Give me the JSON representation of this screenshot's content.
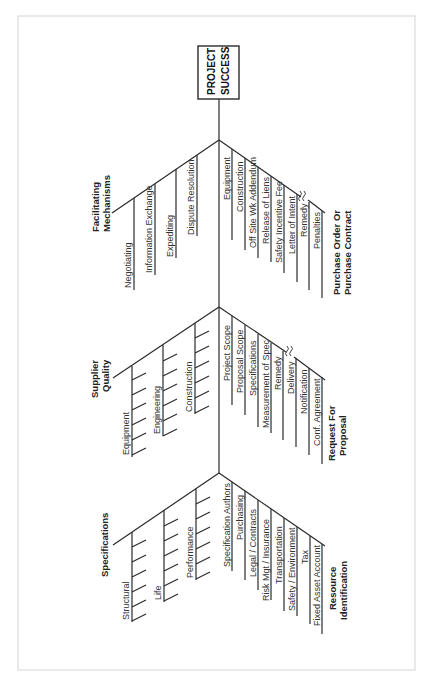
{
  "diagram": {
    "type": "fishbone",
    "orientation": "rotated-90-ccw",
    "head": {
      "label_line1": "PROJECT",
      "label_line2": "SUCCESS"
    },
    "colors": {
      "line": "#2a2a2a",
      "frame": "#d4d4d4",
      "text": "#333333"
    },
    "sections": [
      {
        "left": {
          "category_line1": "Facilitating",
          "category_line2": "Mechanisms",
          "items": [
            "Negotiating",
            "Information Exchange",
            "Expediting",
            "Dispute Resolution"
          ]
        },
        "right": {
          "category_line1": "Purchase Order Or",
          "category_line2": "Purchase Contract",
          "items": [
            "Equipment",
            "Construction",
            "Off Site Wk Addendum",
            "Release of Liens",
            "Safety Incentive Fee",
            "Letter of Intent",
            "Remedy",
            "Penalties"
          ]
        }
      },
      {
        "left": {
          "category_line1": "Supplier",
          "category_line2": "Quality",
          "items": [
            "Equipment",
            "Engineering",
            "Construction"
          ]
        },
        "right": {
          "category_line1": "Request For",
          "category_line2": "Proposal",
          "items": [
            "Project Scope",
            "Proposal Scope",
            "Specifications",
            "Measurement of Spec",
            "Remedy",
            "Delivery",
            "Notification",
            "Conf. Agreement"
          ]
        }
      },
      {
        "left": {
          "category_line1": "Specifications",
          "category_line2": "",
          "items": [
            "Structural",
            "Life",
            "Performance"
          ]
        },
        "right": {
          "category_line1": "Resource",
          "category_line2": "Identification",
          "items": [
            "Specification Authors",
            "Purchasing",
            "Legal / Contracts",
            "Risk Mgt / Insurance",
            "Transportation",
            "Safety / Environment",
            "Tax",
            "Fixed Asset Account"
          ]
        }
      }
    ]
  }
}
